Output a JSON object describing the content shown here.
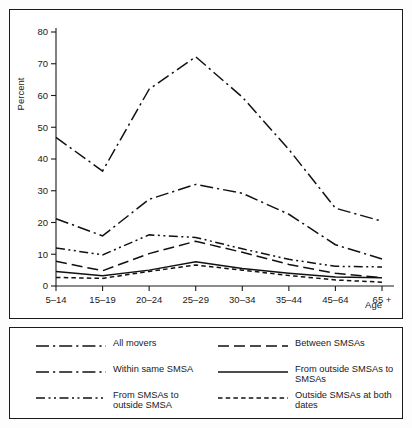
{
  "chart_data": {
    "type": "line",
    "title": "",
    "xlabel": "Age",
    "ylabel": "Percent",
    "ylim": [
      0,
      80
    ],
    "yticks": [
      0,
      10,
      20,
      30,
      40,
      50,
      60,
      70,
      80
    ],
    "grid": false,
    "legend_position": "below",
    "categories": [
      "5–14",
      "15–19",
      "20–24",
      "25–29",
      "30–34",
      "35–44",
      "45–64",
      "65 +"
    ],
    "series": [
      {
        "name": "All movers",
        "style": "long-dash-dot",
        "values": [
          46.8,
          36.2,
          62.0,
          72.2,
          59.5,
          43.0,
          24.5,
          20.4
        ]
      },
      {
        "name": "Within same SMSA",
        "style": "long-dash-dot",
        "values": [
          21.2,
          15.8,
          27.3,
          32.0,
          29.2,
          22.6,
          13.0,
          8.5
        ]
      },
      {
        "name": "From SMSAs to outside SMSA",
        "style": "dash-dot-dot",
        "values": [
          12.0,
          9.8,
          16.1,
          15.3,
          11.7,
          8.4,
          6.2,
          6.0
        ]
      },
      {
        "name": "Between SMSAs",
        "style": "dashed",
        "values": [
          7.8,
          4.8,
          10.2,
          14.1,
          10.6,
          6.8,
          4.0,
          2.6
        ]
      },
      {
        "name": "From outside SMSAs to SMSAs",
        "style": "solid",
        "values": [
          4.6,
          3.2,
          5.0,
          7.6,
          5.5,
          4.0,
          2.8,
          2.6
        ]
      },
      {
        "name": "Outside SMSAs at both dates",
        "style": "short-dash",
        "values": [
          2.7,
          2.4,
          4.6,
          6.6,
          5.0,
          3.3,
          1.9,
          1.2
        ]
      }
    ]
  },
  "axis": {
    "y_title": "Percent",
    "x_title": "Age",
    "y_ticks": [
      "0",
      "10",
      "20",
      "30",
      "40",
      "50",
      "60",
      "70",
      "80"
    ],
    "x_ticks": [
      "5–14",
      "15–19",
      "20–24",
      "25–29",
      "30–34",
      "35–44",
      "45–64",
      "65 +"
    ]
  },
  "legend": {
    "rows": [
      {
        "left": {
          "label": "All movers",
          "style": "long-dash-dot"
        },
        "right": {
          "label": "Between SMSAs",
          "style": "dashed"
        }
      },
      {
        "left": {
          "label": "Within same SMSA",
          "style": "long-dash-dot"
        },
        "right": {
          "label": "From outside SMSAs to SMSAs",
          "style": "solid"
        }
      },
      {
        "left": {
          "label": "From SMSAs to\noutside SMSA",
          "style": "dash-dot-dot"
        },
        "right": {
          "label": "Outside SMSAs at both dates",
          "style": "short-dash"
        }
      }
    ]
  },
  "colors": {
    "ink": "#111111",
    "frame": "#1a1a1a",
    "background": "#ffffff"
  }
}
